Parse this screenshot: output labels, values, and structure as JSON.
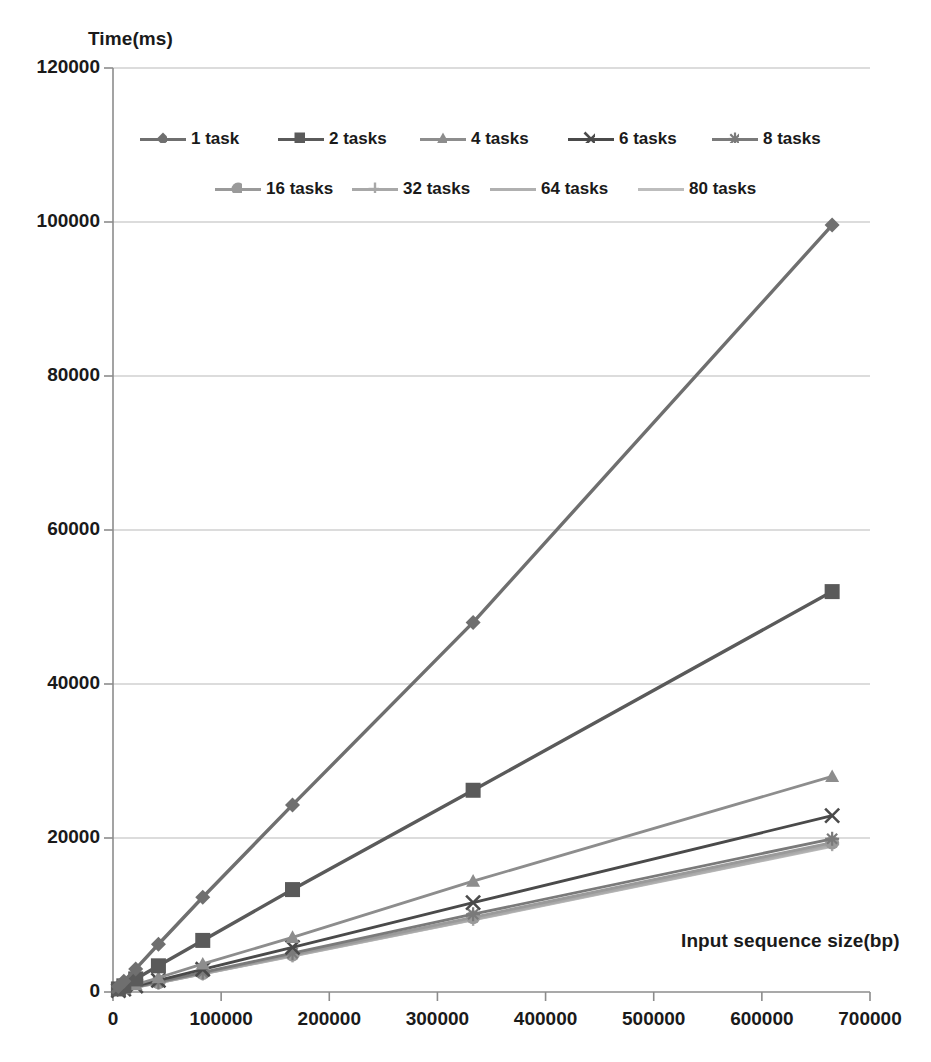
{
  "chart_data": {
    "type": "line",
    "title": "",
    "xlabel": "Input sequence size(bp)",
    "ylabel": "Time(ms)",
    "xlim": [
      0,
      700000
    ],
    "ylim": [
      0,
      120000
    ],
    "xticks": [
      "0",
      "100000",
      "200000",
      "300000",
      "400000",
      "500000",
      "600000",
      "700000"
    ],
    "yticks": [
      "0",
      "20000",
      "40000",
      "60000",
      "80000",
      "100000",
      "120000"
    ],
    "grid": "horizontal",
    "legend_position": "top-inside",
    "x": [
      0,
      5000,
      10000,
      21000,
      42000,
      83000,
      166000,
      333000,
      665000
    ],
    "series": [
      {
        "name": "1 task",
        "marker": "diamond",
        "color": "#6f6f6f",
        "values": [
          0,
          700,
          1400,
          3000,
          6200,
          12300,
          24300,
          48000,
          99600
        ]
      },
      {
        "name": "2 tasks",
        "marker": "square",
        "color": "#5a5a5a",
        "values": [
          0,
          400,
          800,
          1700,
          3400,
          6700,
          13300,
          26200,
          52000
        ]
      },
      {
        "name": "4 tasks",
        "marker": "triangle",
        "color": "#8d8d8d",
        "values": [
          0,
          220,
          450,
          950,
          1850,
          3650,
          7100,
          14400,
          28000
        ]
      },
      {
        "name": "6 tasks",
        "marker": "x",
        "color": "#4a4a4a",
        "values": [
          0,
          180,
          370,
          780,
          1500,
          2950,
          5800,
          11600,
          22900
        ]
      },
      {
        "name": "8 tasks",
        "marker": "star",
        "color": "#7a7a7a",
        "values": [
          0,
          160,
          320,
          680,
          1300,
          2550,
          5050,
          10100,
          19900
        ]
      },
      {
        "name": "16 tasks",
        "marker": "circle",
        "color": "#9a9a9a",
        "values": [
          0,
          150,
          310,
          650,
          1250,
          2450,
          4850,
          9700,
          19400
        ]
      },
      {
        "name": "32 tasks",
        "marker": "plus",
        "color": "#a8a8a8",
        "values": [
          0,
          150,
          300,
          630,
          1220,
          2400,
          4750,
          9500,
          19200
        ]
      },
      {
        "name": "64 tasks",
        "marker": "none",
        "color": "#b0b0b0",
        "values": [
          0,
          145,
          295,
          620,
          1200,
          2360,
          4700,
          9400,
          19000
        ]
      },
      {
        "name": "80 tasks",
        "marker": "none",
        "color": "#bdbdbd",
        "values": [
          0,
          145,
          290,
          615,
          1190,
          2340,
          4660,
          9350,
          18900
        ]
      }
    ]
  },
  "axes": {
    "y_title": "Time(ms)",
    "x_title": "Input sequence size(bp)"
  },
  "legend": {
    "items": [
      {
        "label": "1 task"
      },
      {
        "label": "2 tasks"
      },
      {
        "label": "4 tasks"
      },
      {
        "label": "6 tasks"
      },
      {
        "label": "8 tasks"
      },
      {
        "label": "16 tasks"
      },
      {
        "label": "32 tasks"
      },
      {
        "label": "64 tasks"
      },
      {
        "label": "80 tasks"
      }
    ]
  }
}
